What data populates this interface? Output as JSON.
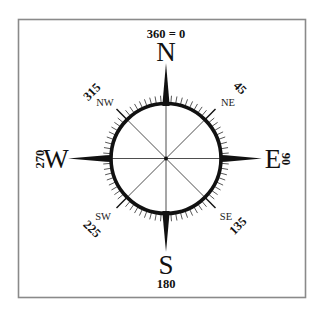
{
  "diagram": {
    "type": "compass-rose",
    "frame": {
      "stroke_color": "#8a8a8a"
    },
    "top_label": "360 = 0",
    "cardinals": [
      {
        "letter": "N",
        "degrees": "360 = 0"
      },
      {
        "letter": "E",
        "degrees": "90"
      },
      {
        "letter": "S",
        "degrees": "180"
      },
      {
        "letter": "W",
        "degrees": "270"
      }
    ],
    "labels": {
      "north": "N",
      "east": "E",
      "south": "S",
      "west": "W",
      "northeast": "NE",
      "southeast": "SE",
      "southwest": "SW",
      "northwest": "NW"
    },
    "degree_labels": {
      "north": "360 = 0",
      "northeast": "45",
      "east": "90",
      "southeast": "135",
      "south": "180",
      "southwest": "225",
      "west": "270",
      "northwest": "315"
    },
    "tick_interval_degrees": 5,
    "colors": {
      "ink": "#111111",
      "frame": "#8a8a8a",
      "background": "#ffffff"
    }
  }
}
